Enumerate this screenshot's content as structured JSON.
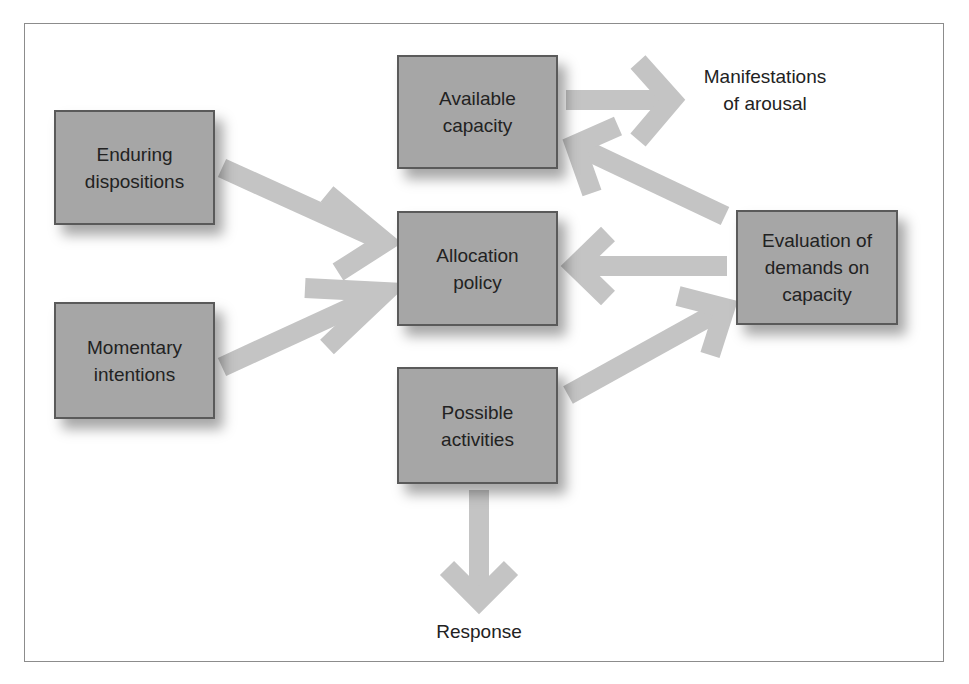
{
  "diagram": {
    "colors": {
      "box_fill": "#a6a6a6",
      "box_border": "#5a5a5a",
      "arrow": "#c4c4c4",
      "frame": "#8c8c8c",
      "text": "#222222"
    },
    "nodes": [
      {
        "id": "enduring",
        "label": "Enduring\ndispositions"
      },
      {
        "id": "momentary",
        "label": "Momentary\nintentions"
      },
      {
        "id": "available",
        "label": "Available\ncapacity"
      },
      {
        "id": "allocation",
        "label": "Allocation\npolicy"
      },
      {
        "id": "possible",
        "label": "Possible\nactivities"
      },
      {
        "id": "evaluation",
        "label": "Evaluation of\ndemands on\ncapacity"
      }
    ],
    "outputs": [
      {
        "id": "arousal",
        "label": "Manifestations\nof arousal"
      },
      {
        "id": "response",
        "label": "Response"
      }
    ],
    "edges": [
      {
        "from": "enduring",
        "to": "allocation"
      },
      {
        "from": "momentary",
        "to": "allocation"
      },
      {
        "from": "available",
        "to": "arousal"
      },
      {
        "from": "evaluation",
        "to": "available"
      },
      {
        "from": "evaluation",
        "to": "allocation"
      },
      {
        "from": "possible",
        "to": "evaluation"
      },
      {
        "from": "possible",
        "to": "response"
      }
    ]
  }
}
